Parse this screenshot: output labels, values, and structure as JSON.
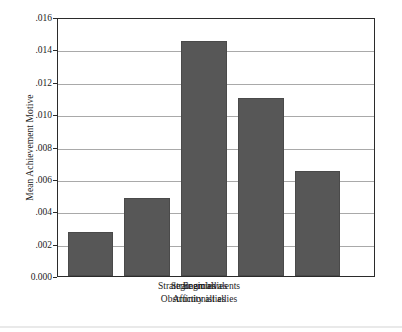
{
  "chart_data": {
    "type": "bar",
    "title": "",
    "xlabel": "",
    "ylabel": "Mean Achievement Motive",
    "categories": [
      "Enemies",
      "Affinity allies",
      "Strategic allies",
      "Obstructionist allies",
      "Strategic ambivalents"
    ],
    "values": [
      0.0027,
      0.0048,
      0.0145,
      0.011,
      0.0065
    ],
    "ylim": [
      0.0,
      0.016
    ],
    "yticks": [
      0.0,
      0.002,
      0.004,
      0.006,
      0.008,
      0.01,
      0.012,
      0.014,
      0.016
    ],
    "ytick_labels": [
      "0.000",
      ".002",
      ".004",
      ".006",
      ".008",
      ".010",
      ".012",
      ".014",
      ".016"
    ],
    "grid": true,
    "legend": "none",
    "bar_color": "#575757",
    "gridline_color": "#a9a9a9",
    "frame_color": "#2b2b2b",
    "background_color": "#ffffff",
    "xtick_label_rows": [
      [
        "Enemies",
        "Strategic allies",
        "Strategic ambivalents"
      ],
      [
        "Affinity allies",
        "Obstructionist allies"
      ]
    ]
  }
}
